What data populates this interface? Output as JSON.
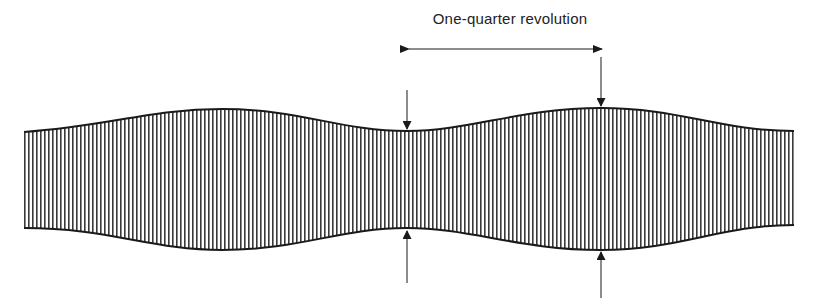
{
  "diagram": {
    "label": "One-quarter revolution",
    "colors": {
      "background": "#ffffff",
      "ink": "#1a1a1a",
      "stripe": "#3a3a3a"
    },
    "band": {
      "left_x": 24,
      "right_x": 794,
      "stripe_spacing_px": 4,
      "fill_pattern": "vertical-lines",
      "profile_points": [
        {
          "x": 24,
          "top": 132,
          "bottom": 228
        },
        {
          "x": 222,
          "top": 109,
          "bottom": 250
        },
        {
          "x": 407,
          "top": 131,
          "bottom": 228
        },
        {
          "x": 601,
          "top": 108,
          "bottom": 250
        },
        {
          "x": 794,
          "top": 131,
          "bottom": 225
        }
      ]
    },
    "markers": [
      {
        "name": "narrow-point",
        "x": 407,
        "down_arrow": {
          "y1": 90,
          "y2": 129
        },
        "up_arrow": {
          "y1": 283,
          "y2": 231
        }
      },
      {
        "name": "wide-point",
        "x": 601,
        "down_arrow": {
          "y1": 57,
          "y2": 106
        },
        "up_arrow": {
          "y1": 298,
          "y2": 252
        }
      }
    ],
    "span_arrow": {
      "x1": 409,
      "x2": 602,
      "y": 49
    }
  }
}
